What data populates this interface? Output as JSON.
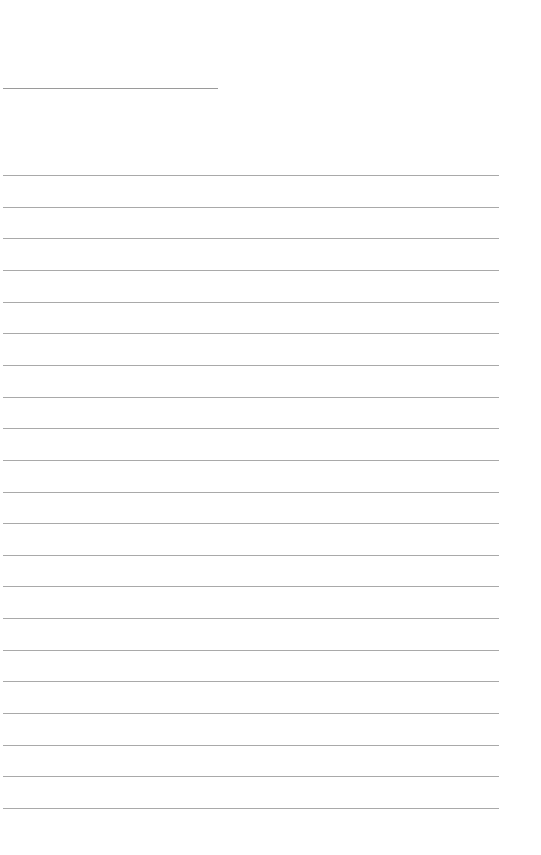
{
  "page": {
    "type": "lined-paper",
    "background": "#ffffff",
    "line_color": "#a9a9a9"
  },
  "header_line": {
    "x": 3,
    "y": 88,
    "width": 215,
    "color": "#9a9a9a"
  },
  "ruled_lines": {
    "count": 21,
    "x": 3,
    "width": 496,
    "first_y": 175,
    "spacing": 31.65,
    "color": "#a9a9a9"
  }
}
